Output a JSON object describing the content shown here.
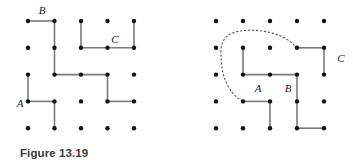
{
  "figure": {
    "caption": "Figure 13.19",
    "width": 353,
    "height": 168,
    "background_color": "#ffffff",
    "dot_color": "#111111",
    "edge_color": "#7a7a7a",
    "curve_color": "#555555",
    "label_color": "#1a1a1a",
    "dot_radius": 2.2,
    "edge_width": 1.6,
    "panels": [
      {
        "id": "left-panel",
        "name": "left-grid-diagram",
        "origin_x": 28,
        "origin_y": 21,
        "pitch_x": 26.5,
        "pitch_y": 26.8,
        "cols": 5,
        "rows": 5,
        "edges": [
          {
            "from": [
              0,
              0
            ],
            "to": [
              1,
              0
            ]
          },
          {
            "from": [
              1,
              0
            ],
            "to": [
              1,
              2
            ]
          },
          {
            "from": [
              2,
              0
            ],
            "to": [
              2,
              1
            ]
          },
          {
            "from": [
              2,
              1
            ],
            "to": [
              4,
              1
            ]
          },
          {
            "from": [
              4,
              0
            ],
            "to": [
              4,
              1
            ]
          },
          {
            "from": [
              1,
              2
            ],
            "to": [
              3,
              2
            ]
          },
          {
            "from": [
              0,
              2
            ],
            "to": [
              0,
              3
            ]
          },
          {
            "from": [
              3,
              2
            ],
            "to": [
              3,
              3
            ]
          },
          {
            "from": [
              0,
              3
            ],
            "to": [
              1,
              3
            ]
          },
          {
            "from": [
              1,
              3
            ],
            "to": [
              1,
              4
            ]
          },
          {
            "from": [
              3,
              3
            ],
            "to": [
              4,
              3
            ]
          }
        ],
        "labels": [
          {
            "text": "B",
            "x": 42,
            "y": 14,
            "anchor": "middle",
            "name": "vertex-label-b"
          },
          {
            "text": "C",
            "x": 115,
            "y": 43,
            "anchor": "middle",
            "name": "vertex-label-c"
          },
          {
            "text": "A",
            "x": 20,
            "y": 107,
            "anchor": "middle",
            "name": "vertex-label-a"
          }
        ],
        "curves": []
      },
      {
        "id": "right-panel",
        "name": "right-grid-diagram",
        "origin_x": 216,
        "origin_y": 21,
        "pitch_x": 27.0,
        "pitch_y": 26.8,
        "cols": 5,
        "rows": 5,
        "edges": [
          {
            "from": [
              1,
              1
            ],
            "to": [
              1,
              2
            ]
          },
          {
            "from": [
              1,
              2
            ],
            "to": [
              3,
              2
            ]
          },
          {
            "from": [
              3,
              1
            ],
            "to": [
              4,
              1
            ]
          },
          {
            "from": [
              4,
              1
            ],
            "to": [
              4,
              2
            ]
          },
          {
            "from": [
              3,
              2
            ],
            "to": [
              3,
              4
            ]
          },
          {
            "from": [
              3,
              4
            ],
            "to": [
              4,
              4
            ]
          },
          {
            "from": [
              1,
              3
            ],
            "to": [
              2,
              3
            ]
          },
          {
            "from": [
              2,
              3
            ],
            "to": [
              2,
              4
            ]
          }
        ],
        "labels": [
          {
            "text": "C",
            "x": 341,
            "y": 62,
            "anchor": "middle",
            "name": "vertex-label-c"
          },
          {
            "text": "A",
            "x": 258,
            "y": 92,
            "anchor": "middle",
            "name": "vertex-label-a"
          },
          {
            "text": "B",
            "x": 288,
            "y": 92,
            "anchor": "middle",
            "name": "vertex-label-b"
          }
        ],
        "curves": [
          {
            "name": "dotted-loop-curve",
            "path": "M 297 48 C 285 33, 258 28, 240 31 C 226 33, 221 41, 221 52 C 221 64, 222 75, 228 86 C 233 95, 238 99, 243 101",
            "dash": "1.4 2.6"
          }
        ]
      }
    ]
  }
}
